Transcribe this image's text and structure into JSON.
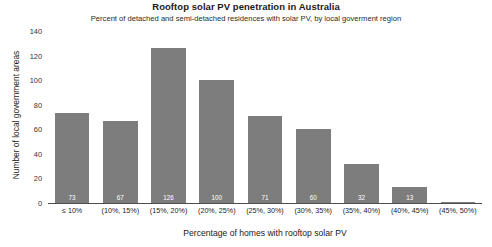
{
  "chart_data": {
    "type": "bar",
    "title": "Rooftop solar PV penetration in Australia",
    "subtitle": "Percent of detached and semi-detached residences with solar PV, by local goverment region",
    "xlabel": "Percentage of homes with rooftop solar PV",
    "ylabel": "Number of local government areas",
    "categories": [
      "≤ 10%",
      "(10%, 15%)",
      "(15%, 20%)",
      "(20%, 25%)",
      "(25%, 30%)",
      "(30%, 35%)",
      "(35%, 40%)",
      "(40%, 45%)",
      "(45%, 50%)"
    ],
    "values": [
      73,
      67,
      126,
      100,
      71,
      60,
      32,
      13,
      1
    ],
    "data_labels": [
      "73",
      "67",
      "126",
      "100",
      "71",
      "60",
      "32",
      "13",
      ""
    ],
    "ylim": [
      0,
      140
    ],
    "yticks": [
      0,
      20,
      40,
      60,
      80,
      100,
      120,
      140
    ],
    "ytick_labels": [
      "0",
      "20",
      "40",
      "60",
      "80",
      "100",
      "120",
      "140"
    ],
    "grid": false,
    "legend": false,
    "legend_position": "none",
    "bar_color": "#7d7d7d",
    "label_color": "#ffffff",
    "axis_color": "#4d4d4d",
    "background_color": "#ffffff"
  }
}
